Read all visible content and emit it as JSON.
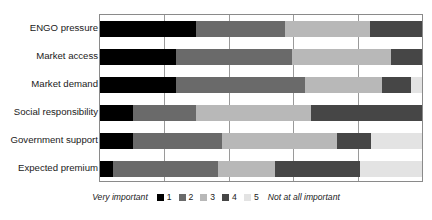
{
  "chart_data": {
    "type": "bar",
    "orientation": "horizontal",
    "stacked": true,
    "normalized_percent": true,
    "title": "",
    "xlabel": "",
    "ylabel": "",
    "xlim": [
      0,
      100
    ],
    "xticks": [
      0,
      20,
      40,
      60,
      80,
      100
    ],
    "grid": true,
    "legend_position": "bottom-center",
    "categories": [
      "ENGO pressure",
      "Market access",
      "Market demand",
      "Social responsibility",
      "Government support",
      "Expected premium"
    ],
    "series": [
      {
        "name": "1",
        "label": "1",
        "color": "#000000",
        "values": [
          29.8,
          23.5,
          23.7,
          10.3,
          10.3,
          3.9
        ]
      },
      {
        "name": "2",
        "label": "2",
        "color": "#6a6a6a",
        "values": [
          27.8,
          36.2,
          40.1,
          19.5,
          27.6,
          32.6
        ]
      },
      {
        "name": "3",
        "label": "3",
        "color": "#b8b8b8",
        "values": [
          26.4,
          30.6,
          23.9,
          35.8,
          35.7,
          17.8
        ]
      },
      {
        "name": "4",
        "label": "4",
        "color": "#464646",
        "values": [
          16.0,
          9.7,
          9.0,
          34.4,
          10.6,
          26.5
        ]
      },
      {
        "name": "5",
        "label": "5",
        "color": "#e3e3e3",
        "values": [
          0.0,
          0.0,
          3.3,
          0.0,
          15.8,
          19.2
        ]
      }
    ],
    "legend": {
      "left_text": "Very important",
      "right_text": "Not at all important",
      "entries": [
        {
          "label": "1",
          "color": "#000000"
        },
        {
          "label": "2",
          "color": "#6a6a6a"
        },
        {
          "label": "3",
          "color": "#b8b8b8"
        },
        {
          "label": "4",
          "color": "#464646"
        },
        {
          "label": "5",
          "color": "#e3e3e3"
        }
      ]
    },
    "colors": {
      "axis": "#8a8a8a",
      "gridline": "#9a9a9a",
      "text": "#1a1a1a",
      "background": "#ffffff"
    }
  }
}
